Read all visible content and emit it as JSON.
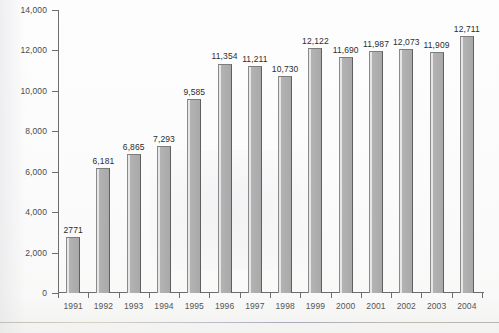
{
  "chart_data": {
    "type": "bar",
    "title": "",
    "subtitle": "",
    "xlabel": "",
    "ylabel": "",
    "categories": [
      "1991",
      "1992",
      "1993",
      "1994",
      "1995",
      "1996",
      "1997",
      "1998",
      "1999",
      "2000",
      "2001",
      "2002",
      "2003",
      "2004"
    ],
    "values": [
      2771,
      6181,
      6865,
      7293,
      9585,
      11354,
      11211,
      10730,
      12122,
      11690,
      11987,
      12073,
      11909,
      12711
    ],
    "data_labels": [
      "2771",
      "6,181",
      "6,865",
      "7,293",
      "9,585",
      "11,354",
      "11,211",
      "10,730",
      "12,122",
      "11,690",
      "11,987",
      "12,073",
      "11,909",
      "12,711"
    ],
    "ylim": [
      0,
      14000
    ],
    "ytick_values": [
      0,
      2000,
      4000,
      6000,
      8000,
      10000,
      12000,
      14000
    ],
    "ytick_labels": [
      "0",
      "2,000",
      "4,000",
      "6,000",
      "8,000",
      "10,000",
      "12,000",
      "14,000"
    ],
    "grid": false,
    "legend": null,
    "legend_position": "none",
    "bar_color": "#a9a9a9",
    "bar_edge_color": "#5f5f5f",
    "axis_color": "#6d6d6d",
    "text_color": "#2d2d2d",
    "background_color": "#ffffff"
  }
}
